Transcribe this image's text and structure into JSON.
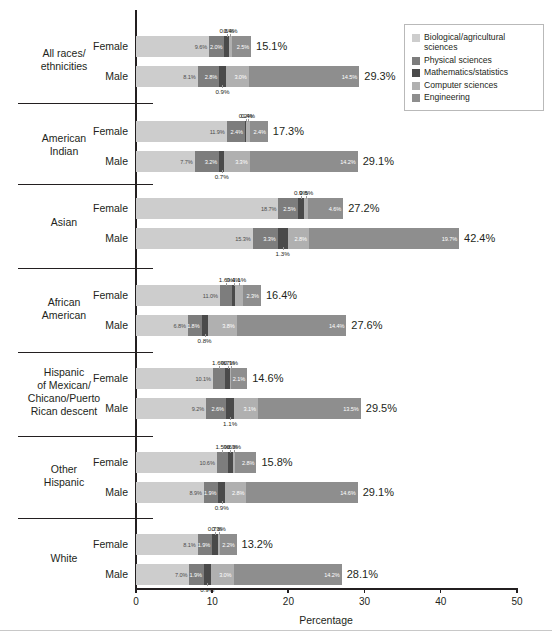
{
  "chart_data": {
    "type": "bar",
    "orientation": "horizontal",
    "stacked": true,
    "title": "",
    "xlabel": "Percentage",
    "ylabel": "",
    "xlim": [
      0,
      50
    ],
    "xticks": [
      "0",
      "10",
      "20",
      "30",
      "40",
      "50"
    ],
    "grid": false,
    "legend_position": "top-right",
    "series": [
      {
        "name": "Biological/agricultural sciences",
        "color": "#cdcdcd"
      },
      {
        "name": "Physical sciences",
        "color": "#7d7d7d"
      },
      {
        "name": "Mathematics/statistics",
        "color": "#4a4a4a"
      },
      {
        "name": "Computer sciences",
        "color": "#b0b0b0"
      },
      {
        "name": "Engineering",
        "color": "#8e8e8e"
      }
    ],
    "groups": [
      {
        "name": "All races/ethnicities",
        "rows": [
          {
            "label": "Female",
            "total": "15.1%",
            "values": [
              9.6,
              2.0,
              0.6,
              0.4,
              2.5
            ],
            "value_labels": [
              "9.6%",
              "2.0%",
              "0.6%",
              "0.4%",
              "2.5%"
            ]
          },
          {
            "label": "Male",
            "total": "29.3%",
            "values": [
              8.1,
              2.8,
              0.9,
              3.0,
              14.5
            ],
            "value_labels": [
              "8.1%",
              "2.8%",
              "0.9%",
              "3.0%",
              "14.5%"
            ]
          }
        ]
      },
      {
        "name": "American Indian",
        "rows": [
          {
            "label": "Female",
            "total": "17.3%",
            "values": [
              11.9,
              2.4,
              0.2,
              0.4,
              2.4
            ],
            "value_labels": [
              "11.9%",
              "2.4%",
              "0.2%",
              "0.4%",
              "2.4%"
            ]
          },
          {
            "label": "Male",
            "total": "29.1%",
            "values": [
              7.7,
              3.2,
              0.7,
              3.3,
              14.2
            ],
            "value_labels": [
              "7.7%",
              "3.2%",
              "0.7%",
              "3.3%",
              "14.2%"
            ]
          }
        ]
      },
      {
        "name": "Asian",
        "rows": [
          {
            "label": "Female",
            "total": "27.2%",
            "values": [
              18.7,
              2.5,
              0.9,
              0.5,
              4.6
            ],
            "value_labels": [
              "18.7%",
              "2.5%",
              "0.9%",
              "0.5%",
              "4.6%"
            ]
          },
          {
            "label": "Male",
            "total": "42.4%",
            "values": [
              15.3,
              3.3,
              1.3,
              2.8,
              19.7
            ],
            "value_labels": [
              "15.3%",
              "3.3%",
              "1.3%",
              "2.8%",
              "19.7%"
            ]
          }
        ]
      },
      {
        "name": "African American",
        "rows": [
          {
            "label": "Female",
            "total": "16.4%",
            "values": [
              11.0,
              1.6,
              0.4,
              1.1,
              2.3
            ],
            "value_labels": [
              "11.0%",
              "1.6%",
              "0.4%",
              "1.1%",
              "2.3%"
            ]
          },
          {
            "label": "Male",
            "total": "27.6%",
            "values": [
              6.8,
              1.8,
              0.8,
              3.8,
              14.4
            ],
            "value_labels": [
              "6.8%",
              "1.8%",
              "0.8%",
              "3.8%",
              "14.4%"
            ]
          }
        ]
      },
      {
        "name": "Hispanic of Mexican/Chicano/Puerto Rican descent",
        "rows": [
          {
            "label": "Female",
            "total": "14.6%",
            "values": [
              10.1,
              1.6,
              0.7,
              0.1,
              2.1
            ],
            "value_labels": [
              "10.1%",
              "1.6%",
              "0.7%",
              "0.1%",
              "2.1%"
            ]
          },
          {
            "label": "Male",
            "total": "29.5%",
            "values": [
              9.2,
              2.6,
              1.1,
              3.1,
              13.5
            ],
            "value_labels": [
              "9.2%",
              "2.6%",
              "1.1%",
              "3.1%",
              "13.5%"
            ]
          }
        ]
      },
      {
        "name": "Other Hispanic",
        "rows": [
          {
            "label": "Female",
            "total": "15.8%",
            "values": [
              10.6,
              1.5,
              0.6,
              0.3,
              2.8
            ],
            "value_labels": [
              "10.6%",
              "1.5%",
              "0.6%",
              "0.3%",
              "2.8%"
            ]
          },
          {
            "label": "Male",
            "total": "29.1%",
            "values": [
              8.9,
              1.9,
              0.9,
              2.8,
              14.6
            ],
            "value_labels": [
              "8.9%",
              "1.9%",
              "0.9%",
              "2.8%",
              "14.6%"
            ]
          }
        ]
      },
      {
        "name": "White",
        "rows": [
          {
            "label": "Female",
            "total": "13.2%",
            "values": [
              8.1,
              1.9,
              0.7,
              0.3,
              2.2
            ],
            "value_labels": [
              "8.1%",
              "1.9%",
              "0.7%",
              "0.3%",
              "2.2%"
            ]
          },
          {
            "label": "Male",
            "total": "28.1%",
            "values": [
              7.0,
              1.9,
              0.9,
              3.0,
              14.2
            ],
            "value_labels": [
              "7.0%",
              "1.9%",
              "0.9%",
              "3.0%",
              "14.2%"
            ]
          }
        ]
      }
    ]
  },
  "legend": {
    "items": [
      {
        "label": "Biological/agricultural sciences",
        "color": "#cdcdcd"
      },
      {
        "label": "Physical sciences",
        "color": "#7d7d7d"
      },
      {
        "label": "Mathematics/statistics",
        "color": "#4a4a4a"
      },
      {
        "label": "Computer sciences",
        "color": "#b0b0b0"
      },
      {
        "label": "Engineering",
        "color": "#8e8e8e"
      }
    ]
  },
  "axis": {
    "title": "Percentage",
    "ticks": [
      "0",
      "10",
      "20",
      "30",
      "40",
      "50"
    ]
  },
  "group_label_lines": {
    "g0": [
      "All races/",
      "ethnicities"
    ],
    "g1": [
      "American",
      "Indian"
    ],
    "g2": [
      "Asian"
    ],
    "g3": [
      "African",
      "American"
    ],
    "g4": [
      "Hispanic",
      "of Mexican/",
      "Chicano/Puerto",
      "Rican descent"
    ],
    "g5": [
      "Other",
      "Hispanic"
    ],
    "g6": [
      "White"
    ]
  }
}
